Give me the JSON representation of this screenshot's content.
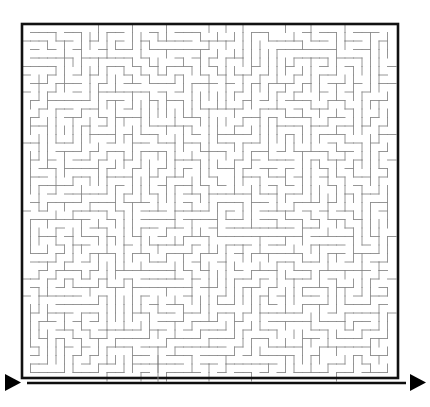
{
  "puzzle": {
    "type": "maze",
    "title": "",
    "grid": {
      "cols": 44,
      "rows": 42,
      "cell_px": 8.5,
      "origin_x": 22,
      "origin_y": 24,
      "width_px": 376,
      "height_px": 354
    },
    "colors": {
      "background": "#ffffff",
      "border": "#111111",
      "wall": "#8a8a8a",
      "baseline": "#0d0d0d",
      "arrow": "#000000",
      "divider": "#8a8a8a"
    },
    "border": {
      "stroke_width": 2.6,
      "closed": true,
      "label": "maze-outer-border"
    },
    "walls": {
      "stroke_width": 0.9,
      "style": "orthogonal-perfect-maze"
    },
    "seed": 20240617,
    "entrance": {
      "label": "start",
      "side": "left",
      "marker": "triangle-right"
    },
    "exit": {
      "label": "finish",
      "side": "right",
      "marker": "triangle-right"
    },
    "markers": {
      "left_arrow": {
        "name": "start-arrow",
        "x": 5,
        "y": 374,
        "width": 16,
        "height": 17,
        "direction": "right"
      },
      "right_arrow": {
        "name": "finish-arrow",
        "x": 410,
        "y": 374,
        "width": 16,
        "height": 17,
        "direction": "right"
      }
    },
    "baseline": {
      "name": "base-rule",
      "x1": 27,
      "x2": 406,
      "y": 383,
      "stroke_width": 2.4
    },
    "divider": {
      "name": "center-tick",
      "x": 158,
      "y1": 356,
      "y2": 382,
      "stroke_width": 0.9
    }
  }
}
